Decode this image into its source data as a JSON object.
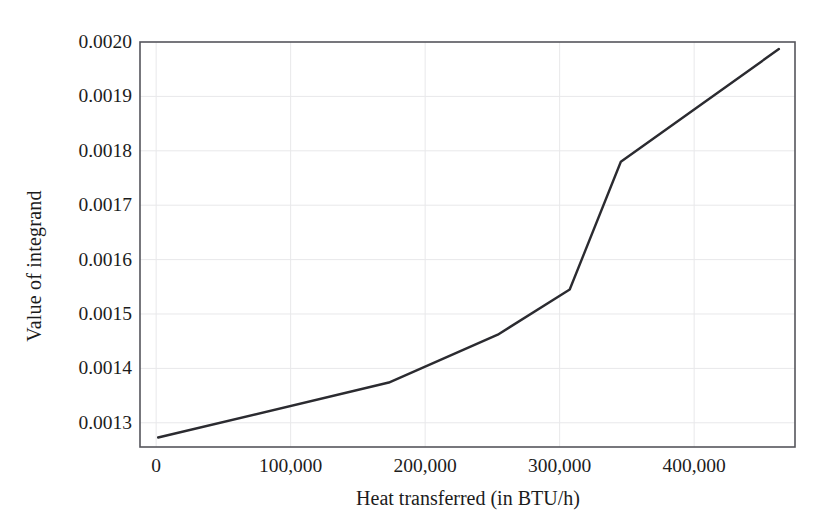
{
  "chart_data": {
    "type": "line",
    "title": "",
    "subtitle": "",
    "xlabel": "Heat transferred (in BTU/h)",
    "ylabel": "Value of integrand",
    "xlim": [
      -12000,
      475000
    ],
    "ylim": [
      0.0012555,
      0.002
    ],
    "xticks": [
      0,
      100000,
      200000,
      300000,
      400000
    ],
    "xticklabels": [
      "0",
      "100,000",
      "200,000",
      "300,000",
      "400,000"
    ],
    "yticks": [
      0.0013,
      0.0014,
      0.0015,
      0.0016,
      0.0017,
      0.0018,
      0.0019,
      0.002
    ],
    "yticklabels": [
      "0.0013",
      "0.0014",
      "0.0015",
      "0.0016",
      "0.0017",
      "0.0018",
      "0.0019",
      "0.0020"
    ],
    "grid": true,
    "grid_axis": "both",
    "grid_color": "#e8e8ea",
    "legend": null,
    "legend_position": "none",
    "frame": true,
    "frame_color": "#55555c",
    "line_color": "#2b2b30",
    "line_width": 2.4,
    "markers": false,
    "series": [
      {
        "name": "Value of integrand vs heat transferred",
        "x": [
          1500,
          173000,
          254000,
          307500,
          345500,
          463000
        ],
        "y": [
          0.001273,
          0.001374,
          0.001462,
          0.001545,
          0.00178,
          0.001987
        ]
      }
    ],
    "annotations": []
  }
}
